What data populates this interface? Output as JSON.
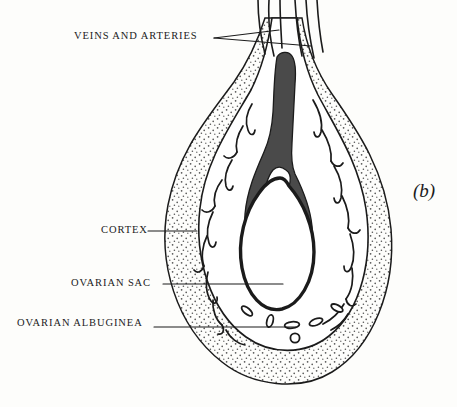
{
  "figure": {
    "marker": "(b)",
    "background_color": "#fdfdfb",
    "ink_color": "#1b1b1b",
    "medulla_color": "#4a4a4a",
    "stipple_color": "#555555",
    "type": "anatomical-line-drawing"
  },
  "labels": [
    {
      "id": "veins-arteries",
      "text": "VEINS AND ARTERIES",
      "leader_count": 2,
      "points_to": "vascular-pedicle-tubes"
    },
    {
      "id": "cortex",
      "text": "CORTEX",
      "leader_count": 1,
      "points_to": "stippled-cortex-region"
    },
    {
      "id": "ovarian-sac",
      "text": "OVARIAN SAC",
      "leader_count": 1,
      "points_to": "central-white-sac"
    },
    {
      "id": "ovarian-albuginea",
      "text": "OVARIAN ALBUGINEA",
      "leader_count": 1,
      "points_to": "sac-wall-outline"
    }
  ],
  "structures": [
    {
      "id": "cortex",
      "name": "Cortex",
      "fill": "stipple"
    },
    {
      "id": "vessel-band",
      "name": "Vascular band",
      "fill": "white"
    },
    {
      "id": "medulla",
      "name": "Medulla",
      "fill": "#4a4a4a"
    },
    {
      "id": "ovarian-sac",
      "name": "Ovarian sac",
      "fill": "white"
    },
    {
      "id": "pedicle",
      "name": "Vascular pedicle",
      "fill": "white"
    }
  ]
}
